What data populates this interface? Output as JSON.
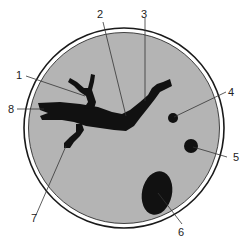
{
  "diagram": {
    "colors": {
      "background": "#ffffff",
      "dish_fill": "#b4b4b4",
      "dish_outline": "#1a1a1a",
      "specimen": "#111111",
      "leader_line": "#333333"
    },
    "callouts": [
      {
        "id": "1",
        "label": "1"
      },
      {
        "id": "2",
        "label": "2"
      },
      {
        "id": "3",
        "label": "3"
      },
      {
        "id": "4",
        "label": "4"
      },
      {
        "id": "5",
        "label": "5"
      },
      {
        "id": "6",
        "label": "6"
      },
      {
        "id": "7",
        "label": "7"
      },
      {
        "id": "8",
        "label": "8"
      }
    ]
  }
}
